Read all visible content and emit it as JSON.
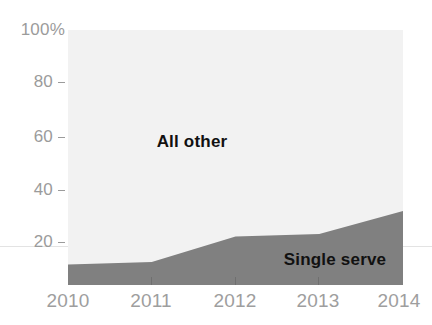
{
  "chart_data": {
    "type": "area",
    "title": "",
    "subtitle": "",
    "xlabel": "",
    "ylabel": "",
    "categories": [
      "2010",
      "2011",
      "2012",
      "2013",
      "2014"
    ],
    "x": [
      2010,
      2011,
      2012,
      2013,
      2014
    ],
    "ylim": [
      0,
      100
    ],
    "xlim": [
      2010,
      2014
    ],
    "grid": false,
    "stacked": true,
    "legend_position": "inline-annotation",
    "series": [
      {
        "name": "Single serve",
        "values": [
          8,
          9,
          19,
          20,
          29
        ],
        "color": "#808080"
      },
      {
        "name": "All other",
        "values": [
          92,
          91,
          81,
          80,
          71
        ],
        "color": "#f2f2f2"
      }
    ],
    "annotations": [
      {
        "text": "All other",
        "x": 2011.5,
        "y": 56
      },
      {
        "text": "Single serve",
        "x": 2013.2,
        "y": 10
      }
    ],
    "y_ticks": [
      {
        "value": 100,
        "label": "100%",
        "has_dash": false
      },
      {
        "value": 80,
        "label": "80",
        "has_dash": true
      },
      {
        "value": 60,
        "label": "60",
        "has_dash": true
      },
      {
        "value": 40,
        "label": "40",
        "has_dash": true
      },
      {
        "value": 20,
        "label": "20",
        "has_dash": true
      }
    ],
    "x_ticks": [
      {
        "value": 2010,
        "label": "2010"
      },
      {
        "value": 2011,
        "label": "2011"
      },
      {
        "value": 2012,
        "label": "2012"
      },
      {
        "value": 2013,
        "label": "2013"
      },
      {
        "value": 2014,
        "label": "2014"
      }
    ],
    "colors": {
      "plot_background": "#f2f2f2",
      "page_background": "#ffffff",
      "single_serve_fill": "#808080",
      "axis_text": "#9b9b9b",
      "annotation_text": "#111111",
      "rule": "#e3e3e3",
      "tick_mark": "#6f6f6f"
    }
  }
}
